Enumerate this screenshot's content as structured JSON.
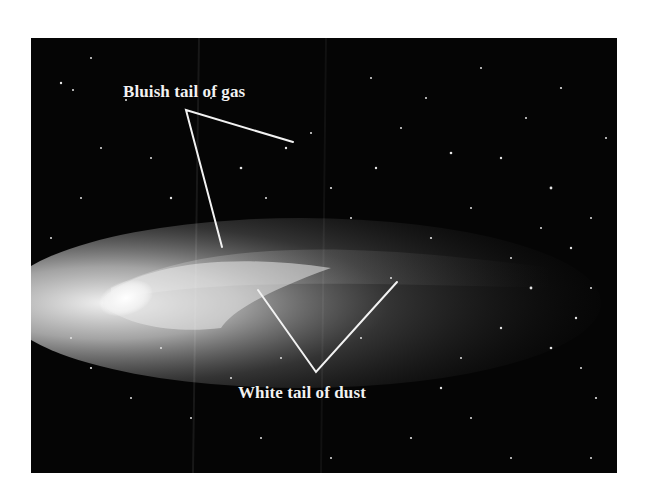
{
  "figure": {
    "labels": {
      "gas_tail": "Bluish tail of gas",
      "dust_tail": "White tail of dust"
    },
    "colors": {
      "background": "#ffffff",
      "sky": "#050505",
      "annotation": "#f2f2f2",
      "coma": "#ffffff"
    }
  }
}
